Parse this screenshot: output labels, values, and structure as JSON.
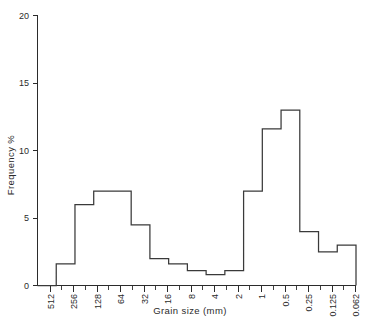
{
  "chart_data": {
    "type": "bar",
    "title": "",
    "subtitle": "",
    "xlabel": "Grain size (mm)",
    "ylabel": "Frequency %",
    "grid": false,
    "legend": null,
    "xlim_labels": [
      "512",
      "0.062"
    ],
    "ylim": [
      0,
      20
    ],
    "y_ticks": [
      0,
      5,
      10,
      15,
      20
    ],
    "y_tick_labels": [
      "0",
      "5",
      "10",
      "15",
      "20"
    ],
    "x_tick_labels": [
      "512",
      "256",
      "128",
      "64",
      "32",
      "16",
      "8",
      "4",
      "2",
      "1",
      "0.5",
      "0.25",
      "0.125",
      "0.062"
    ],
    "x_axis_scale": "log2-descending-phi-classes",
    "categories": [
      "512-256",
      "256-128",
      "128-64",
      "64-32",
      "32-16",
      "16-8",
      "8-4",
      "4-2",
      "2-1",
      "1-0.5",
      "0.5-0.25",
      "0.25-0.125",
      "0.125-0.062",
      "0.062-"
    ],
    "values": [
      0,
      1.6,
      6.0,
      7.0,
      4.5,
      2.0,
      1.6,
      1.1,
      0.8,
      1.1,
      7.0,
      11.6,
      13.0,
      2.5
    ],
    "series": [
      {
        "name": "Frequency %",
        "values": [
          0,
          1.6,
          6.0,
          7.0,
          4.5,
          2.0,
          1.6,
          1.1,
          0.8,
          1.1,
          7.0,
          11.6,
          13.0,
          2.5
        ]
      }
    ],
    "step_outline_values": [
      0,
      1.6,
      6.0,
      7.0,
      7.0,
      4.5,
      2.0,
      1.6,
      1.1,
      0.8,
      1.1,
      7.0,
      11.6,
      13.0,
      4.0,
      2.5,
      3.0
    ],
    "annotations": []
  },
  "style": {
    "line_color": "#3a3a3a",
    "axis_color": "#2b2b2b",
    "background": "#ffffff"
  }
}
